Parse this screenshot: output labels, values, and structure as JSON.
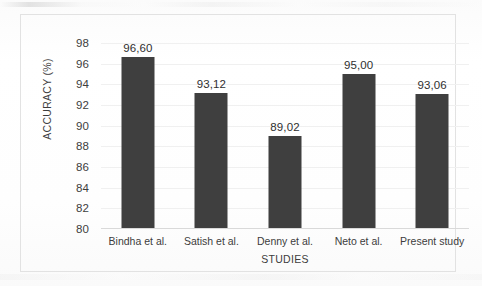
{
  "chart_data": {
    "type": "bar",
    "title": "",
    "xlabel": "STUDIES",
    "ylabel": "ACCURACY  (%)",
    "categories": [
      "Bindha et al.",
      "Satish et al.",
      "Denny et al.",
      "Neto et al.",
      "Present study"
    ],
    "values": [
      96.6,
      93.12,
      89.02,
      95.0,
      93.06
    ],
    "value_labels": [
      "96,60",
      "93,12",
      "89,02",
      "95,00",
      "93,06"
    ],
    "ylim": [
      80,
      98
    ],
    "ytick_labels": [
      "98",
      "96",
      "94",
      "92",
      "90",
      "88",
      "86",
      "84",
      "82",
      "80"
    ],
    "ytick_values": [
      98,
      96,
      94,
      92,
      90,
      88,
      86,
      84,
      82,
      80
    ],
    "grid": true,
    "legend": false,
    "legend_position": "none",
    "series": [
      {
        "name": "Accuracy",
        "color": "#3f3f3f",
        "values": [
          96.6,
          93.12,
          89.02,
          95.0,
          93.06
        ]
      }
    ],
    "colors": {
      "bar": "#3f3f3f",
      "axis": "#d9d9d9",
      "gridline": "#f0f0f0",
      "frame": "#e2e2e2",
      "text": "#3d3d3d",
      "background": "#fdfdfd"
    }
  }
}
